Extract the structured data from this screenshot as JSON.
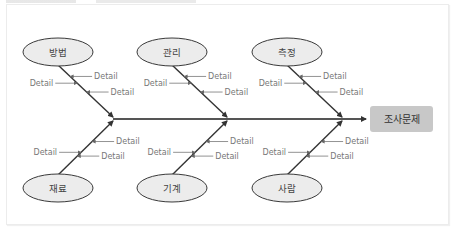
{
  "diagram": {
    "type": "fishbone",
    "effect": "조사문제",
    "categories_top": [
      {
        "label": "방법",
        "details": [
          "Detail",
          "Detail",
          "Detail"
        ]
      },
      {
        "label": "관리",
        "details": [
          "Detail",
          "Detail",
          "Detail"
        ]
      },
      {
        "label": "측정",
        "details": [
          "Detail",
          "Detail",
          "Detail"
        ]
      }
    ],
    "categories_bottom": [
      {
        "label": "재료",
        "details": [
          "Detail",
          "Detail",
          "Detail"
        ]
      },
      {
        "label": "기계",
        "details": [
          "Detail",
          "Detail",
          "Detail"
        ]
      },
      {
        "label": "사람",
        "details": [
          "Detail",
          "Detail",
          "Detail"
        ]
      }
    ],
    "colors": {
      "ellipse_fill": "#ececec",
      "ellipse_stroke": "#3a3a3a",
      "spine": "#555555",
      "bone": "#333333",
      "result_fill": "#c8c8c8",
      "detail_line": "#777777"
    }
  }
}
